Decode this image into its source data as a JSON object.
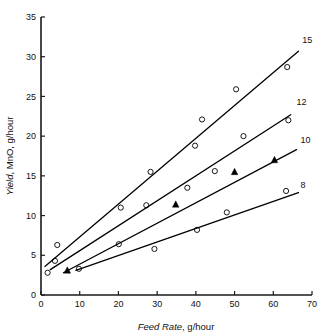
{
  "chart_data": {
    "type": "scatter",
    "title": "",
    "xlabel": "Feed Rate, g/hour",
    "ylabel": "Yield, MnO, g/hour",
    "xlim": [
      0,
      70
    ],
    "ylim": [
      0,
      35
    ],
    "xticks": [
      0,
      10,
      20,
      30,
      40,
      50,
      60,
      70
    ],
    "yticks": [
      0,
      5,
      10,
      15,
      20,
      25,
      30,
      35
    ],
    "xtick_labels": [
      "0",
      "10",
      "20",
      "30",
      "40",
      "50",
      "60",
      "70"
    ],
    "ytick_labels": [
      "0",
      "5",
      "10",
      "15",
      "20",
      "25",
      "30",
      "35"
    ],
    "grid": false,
    "legend_position": "right-of-line-ends",
    "series": [
      {
        "name": "15",
        "label": "15",
        "label_x": 67.5,
        "label_y": 31.4,
        "marker": "open-circle",
        "line": {
          "x0": 1.0,
          "y0": 3.6,
          "x1": 66.5,
          "y1": 30.7
        },
        "points": [
          {
            "x": 4.2,
            "y": 6.3
          },
          {
            "x": 20.6,
            "y": 11.0
          },
          {
            "x": 28.3,
            "y": 15.5
          },
          {
            "x": 39.8,
            "y": 18.8
          },
          {
            "x": 41.6,
            "y": 22.1
          },
          {
            "x": 50.4,
            "y": 25.9
          },
          {
            "x": 63.6,
            "y": 28.7
          }
        ]
      },
      {
        "name": "12",
        "label": "12",
        "label_x": 66.0,
        "label_y": 23.6,
        "marker": "open-circle",
        "line": {
          "x0": 2.4,
          "y0": 3.2,
          "x1": 64.5,
          "y1": 22.7
        },
        "points": [
          {
            "x": 3.6,
            "y": 4.3
          },
          {
            "x": 27.2,
            "y": 11.3
          },
          {
            "x": 37.8,
            "y": 13.5
          },
          {
            "x": 44.9,
            "y": 15.6
          },
          {
            "x": 52.3,
            "y": 20.0
          },
          {
            "x": 63.9,
            "y": 22.0
          }
        ]
      },
      {
        "name": "10",
        "label": "10",
        "label_x": 67.0,
        "label_y": 18.8,
        "marker": "filled-triangle",
        "line": {
          "x0": 5.8,
          "y0": 2.8,
          "x1": 66.0,
          "y1": 18.3
        },
        "points": [
          {
            "x": 6.8,
            "y": 3.1
          },
          {
            "x": 34.8,
            "y": 11.4
          },
          {
            "x": 50.0,
            "y": 15.5
          },
          {
            "x": 60.3,
            "y": 17.0
          }
        ]
      },
      {
        "name": "8",
        "label": "8",
        "label_x": 67.0,
        "label_y": 13.1,
        "marker": "open-circle",
        "line": {
          "x0": 9.0,
          "y0": 3.1,
          "x1": 66.5,
          "y1": 12.9
        },
        "points": [
          {
            "x": 1.7,
            "y": 2.8
          },
          {
            "x": 9.8,
            "y": 3.3
          },
          {
            "x": 20.1,
            "y": 6.4
          },
          {
            "x": 29.3,
            "y": 5.8
          },
          {
            "x": 40.3,
            "y": 8.2
          },
          {
            "x": 48.0,
            "y": 10.4
          },
          {
            "x": 63.3,
            "y": 13.1
          }
        ]
      }
    ]
  },
  "figure": {
    "xaxis_title_plain_tail": ", g/hour",
    "xaxis_title_italic_head": "Feed Rate",
    "yaxis_title_italic_head": "Yield",
    "yaxis_title_plain_tail": ", MnO, g/hour"
  }
}
